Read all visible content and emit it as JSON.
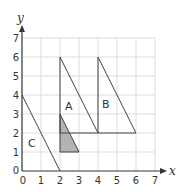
{
  "diagram": {
    "axes": {
      "x_label": "x",
      "y_label": "y",
      "x_ticks": [
        "0",
        "1",
        "2",
        "3",
        "4",
        "5",
        "6",
        "7"
      ],
      "y_ticks": [
        "1",
        "2",
        "3",
        "4",
        "5",
        "6",
        "7"
      ],
      "origin_label": "0",
      "range": {
        "x": [
          0,
          7
        ],
        "y": [
          0,
          7
        ]
      }
    },
    "shapes": [
      {
        "label": "A",
        "vertices": [
          [
            2,
            2
          ],
          [
            2,
            6
          ],
          [
            4,
            2
          ]
        ],
        "fill": "none"
      },
      {
        "label": "B",
        "vertices": [
          [
            4,
            2
          ],
          [
            4,
            6
          ],
          [
            6,
            2
          ]
        ],
        "fill": "none"
      },
      {
        "label": "C",
        "vertices": [
          [
            0,
            0
          ],
          [
            0,
            4
          ],
          [
            2,
            0
          ]
        ],
        "fill": "none"
      },
      {
        "label": "",
        "vertices": [
          [
            2,
            1
          ],
          [
            2,
            3
          ],
          [
            3,
            1
          ]
        ],
        "fill": "#b3b3b3"
      }
    ],
    "colors": {
      "grid": "#dddddd",
      "axis": "#333333",
      "shape_stroke": "#444444",
      "shaded": "#b3b3b3"
    }
  }
}
